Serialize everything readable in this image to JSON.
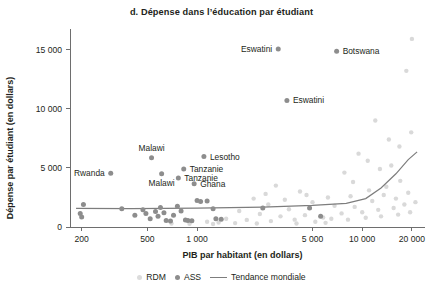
{
  "chart_data": {
    "type": "scatter",
    "title": "d. Dépense dans l’éducation par étudiant",
    "xlabel": "PIB par habitant (en dollars)",
    "ylabel": "Dépense par étudiant (en dollars)",
    "xscale": "log",
    "xlim": [
      170,
      24000
    ],
    "ylim": [
      0,
      16400
    ],
    "xticks": [
      200,
      500,
      1000,
      5000,
      10000,
      20000
    ],
    "xticklabels": [
      "200",
      "500",
      "1 000",
      "5 000",
      "10 000",
      "20 000"
    ],
    "yticks": [
      0,
      5000,
      10000,
      15000
    ],
    "yticklabels": [
      "0",
      "5 000",
      "10 000",
      "15 000"
    ],
    "grid": false,
    "legend_position": "bottom",
    "legend": [
      {
        "name": "RDM",
        "marker": "circle",
        "color": "#dcdcdc"
      },
      {
        "name": "ASS",
        "marker": "circle",
        "color": "#8d8d8d"
      },
      {
        "name": "Tendance mondiale",
        "marker": "line",
        "color": "#7d7d7d"
      }
    ],
    "series": [
      {
        "name": "ASS",
        "color": "#8d8d8d",
        "points": [
          {
            "x": 3100,
            "y": 15050,
            "label": "Eswatini",
            "label_side": "left"
          },
          {
            "x": 7000,
            "y": 14850,
            "label": "Botswana",
            "label_side": "right"
          },
          {
            "x": 3500,
            "y": 10700,
            "label": "Eswatini",
            "label_side": "right"
          },
          {
            "x": 530,
            "y": 5850,
            "label": "Malawi",
            "label_side": "above"
          },
          {
            "x": 1100,
            "y": 5950,
            "label": "Lesotho",
            "label_side": "right"
          },
          {
            "x": 300,
            "y": 4550,
            "label": "Rwanda",
            "label_side": "left"
          },
          {
            "x": 610,
            "y": 4500,
            "label": "Malawi",
            "label_side": "below"
          },
          {
            "x": 830,
            "y": 4900,
            "label": "Tanzanie",
            "label_side": "right"
          },
          {
            "x": 770,
            "y": 4150,
            "label": "Tanzanie",
            "label_side": "right"
          },
          {
            "x": 960,
            "y": 3650,
            "label": "Ghana",
            "label_side": "right"
          },
          {
            "x": 205,
            "y": 1900
          },
          {
            "x": 196,
            "y": 1150
          },
          {
            "x": 200,
            "y": 850
          },
          {
            "x": 350,
            "y": 1550
          },
          {
            "x": 420,
            "y": 1000
          },
          {
            "x": 470,
            "y": 1450
          },
          {
            "x": 490,
            "y": 1150
          },
          {
            "x": 520,
            "y": 700
          },
          {
            "x": 560,
            "y": 1300
          },
          {
            "x": 580,
            "y": 900
          },
          {
            "x": 600,
            "y": 1650
          },
          {
            "x": 630,
            "y": 1200
          },
          {
            "x": 650,
            "y": 550
          },
          {
            "x": 690,
            "y": 500
          },
          {
            "x": 720,
            "y": 1000
          },
          {
            "x": 760,
            "y": 1750
          },
          {
            "x": 800,
            "y": 1350
          },
          {
            "x": 850,
            "y": 600
          },
          {
            "x": 880,
            "y": 560
          },
          {
            "x": 930,
            "y": 520
          },
          {
            "x": 1000,
            "y": 2250
          },
          {
            "x": 1050,
            "y": 2150
          },
          {
            "x": 1150,
            "y": 2200
          },
          {
            "x": 1250,
            "y": 1550
          },
          {
            "x": 1300,
            "y": 700
          },
          {
            "x": 1400,
            "y": 650
          },
          {
            "x": 2500,
            "y": 1600
          },
          {
            "x": 4800,
            "y": 1600
          },
          {
            "x": 5600,
            "y": 900
          }
        ]
      },
      {
        "name": "RDM",
        "color": "#dcdcdc",
        "points": [
          {
            "x": 20000,
            "y": 15900
          },
          {
            "x": 18500,
            "y": 13200
          },
          {
            "x": 12000,
            "y": 9000
          },
          {
            "x": 9500,
            "y": 6200
          },
          {
            "x": 15000,
            "y": 5200
          },
          {
            "x": 7800,
            "y": 4600
          },
          {
            "x": 3000,
            "y": 3500
          },
          {
            "x": 4200,
            "y": 3000
          },
          {
            "x": 6200,
            "y": 2500
          },
          {
            "x": 8500,
            "y": 2600
          },
          {
            "x": 11000,
            "y": 3100
          },
          {
            "x": 14000,
            "y": 3400
          },
          {
            "x": 17000,
            "y": 3900
          },
          {
            "x": 2200,
            "y": 2400
          },
          {
            "x": 2700,
            "y": 1900
          },
          {
            "x": 3600,
            "y": 1500
          },
          {
            "x": 5000,
            "y": 2100
          },
          {
            "x": 6800,
            "y": 1800
          },
          {
            "x": 9000,
            "y": 1700
          },
          {
            "x": 11500,
            "y": 2200
          },
          {
            "x": 13500,
            "y": 2700
          },
          {
            "x": 16000,
            "y": 2400
          },
          {
            "x": 19000,
            "y": 2900
          },
          {
            "x": 1800,
            "y": 1350
          },
          {
            "x": 2400,
            "y": 1100
          },
          {
            "x": 3200,
            "y": 900
          },
          {
            "x": 4500,
            "y": 1000
          },
          {
            "x": 5800,
            "y": 800
          },
          {
            "x": 7500,
            "y": 1150
          },
          {
            "x": 10000,
            "y": 1250
          },
          {
            "x": 12500,
            "y": 1450
          },
          {
            "x": 15500,
            "y": 1600
          },
          {
            "x": 18000,
            "y": 1900
          },
          {
            "x": 21000,
            "y": 2100
          },
          {
            "x": 1500,
            "y": 700
          },
          {
            "x": 2000,
            "y": 600
          },
          {
            "x": 2800,
            "y": 500
          },
          {
            "x": 3900,
            "y": 620
          },
          {
            "x": 5200,
            "y": 450
          },
          {
            "x": 6500,
            "y": 700
          },
          {
            "x": 8200,
            "y": 620
          },
          {
            "x": 10500,
            "y": 780
          },
          {
            "x": 13000,
            "y": 900
          },
          {
            "x": 16500,
            "y": 1050
          },
          {
            "x": 19500,
            "y": 1250
          },
          {
            "x": 1150,
            "y": 450
          },
          {
            "x": 1350,
            "y": 380
          },
          {
            "x": 1700,
            "y": 330
          },
          {
            "x": 2300,
            "y": 300
          },
          {
            "x": 700,
            "y": 300
          },
          {
            "x": 900,
            "y": 280
          },
          {
            "x": 1250,
            "y": 250
          },
          {
            "x": 4000,
            "y": 300
          },
          {
            "x": 6000,
            "y": 350
          },
          {
            "x": 12800,
            "y": 4900
          },
          {
            "x": 10800,
            "y": 5600
          },
          {
            "x": 16800,
            "y": 6800
          },
          {
            "x": 19800,
            "y": 8000
          },
          {
            "x": 14500,
            "y": 7400
          },
          {
            "x": 8800,
            "y": 3800
          },
          {
            "x": 2600,
            "y": 2800
          },
          {
            "x": 3400,
            "y": 2300
          },
          {
            "x": 4600,
            "y": 2700
          }
        ]
      }
    ],
    "trend_line": {
      "name": "Tendance mondiale",
      "points": [
        {
          "x": 185,
          "y": 1570
        },
        {
          "x": 400,
          "y": 1560
        },
        {
          "x": 1000,
          "y": 1600
        },
        {
          "x": 2500,
          "y": 1680
        },
        {
          "x": 5000,
          "y": 1820
        },
        {
          "x": 8000,
          "y": 2000
        },
        {
          "x": 10500,
          "y": 2400
        },
        {
          "x": 13000,
          "y": 3300
        },
        {
          "x": 16000,
          "y": 4500
        },
        {
          "x": 19000,
          "y": 5700
        },
        {
          "x": 21500,
          "y": 6350
        }
      ]
    }
  }
}
